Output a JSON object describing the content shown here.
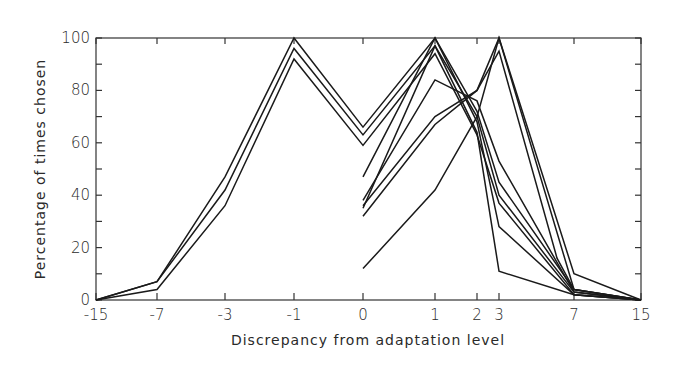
{
  "chart_data": {
    "type": "line",
    "title": "",
    "xlabel": "Discrepancy from adaptation level",
    "ylabel": "Percentage of times chosen",
    "x": [
      -15,
      -7,
      -3,
      -1,
      0,
      1,
      2,
      3,
      7,
      15
    ],
    "x_tick_labels": [
      "-15",
      "-7",
      "-3",
      "-1",
      "0",
      "1",
      "2",
      "3",
      "7",
      "15"
    ],
    "y_ticks": [
      0,
      20,
      40,
      60,
      80,
      100
    ],
    "y_tick_labels": [
      "0",
      "20",
      "40",
      "60",
      "80",
      "100"
    ],
    "ylim": [
      0,
      100
    ],
    "grid": false,
    "legend": null,
    "series": [
      {
        "name": "Series 1",
        "x": [
          -15,
          -7,
          -3,
          -1,
          0,
          1,
          2,
          3,
          7,
          15
        ],
        "values": [
          0,
          7,
          47,
          100,
          66,
          100,
          72,
          45,
          4,
          0
        ]
      },
      {
        "name": "Series 2",
        "x": [
          -15,
          -7,
          -3,
          -1,
          0,
          1,
          2,
          3,
          7,
          15
        ],
        "values": [
          0,
          7,
          42,
          96,
          63,
          97,
          70,
          40,
          3,
          0
        ]
      },
      {
        "name": "Series 3",
        "x": [
          -15,
          -7,
          -3,
          -1,
          0,
          1,
          2,
          3,
          7,
          15
        ],
        "values": [
          0,
          4,
          36,
          92,
          59,
          94,
          63,
          37,
          2,
          0
        ]
      },
      {
        "name": "Series 4",
        "x": [
          0,
          1,
          2,
          3,
          7,
          15
        ],
        "values": [
          47,
          100,
          68,
          28,
          2,
          0
        ]
      },
      {
        "name": "Series 5",
        "x": [
          0,
          1,
          2,
          3,
          7,
          15
        ],
        "values": [
          38,
          84,
          76,
          53,
          3,
          0
        ]
      },
      {
        "name": "Series 6",
        "x": [
          0,
          1,
          2,
          3,
          7,
          15
        ],
        "values": [
          36,
          70,
          80,
          100,
          10,
          0
        ]
      },
      {
        "name": "Series 7",
        "x": [
          0,
          1,
          2,
          3,
          6,
          7,
          15
        ],
        "values": [
          32,
          67,
          80,
          95,
          16,
          4,
          0
        ]
      },
      {
        "name": "Series 8",
        "x": [
          0,
          1,
          2,
          3,
          7,
          15
        ],
        "values": [
          12,
          42,
          70,
          100,
          4,
          0
        ]
      },
      {
        "name": "Series 9",
        "x": [
          0,
          1,
          2,
          3,
          7,
          15
        ],
        "values": [
          35,
          97,
          64,
          11,
          2,
          0
        ]
      }
    ]
  }
}
